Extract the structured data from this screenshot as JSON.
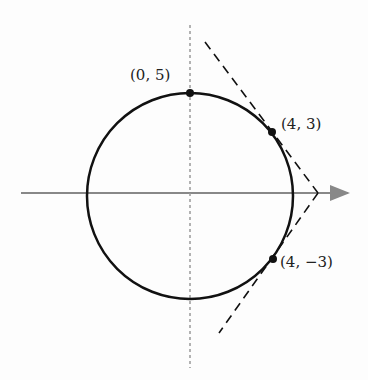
{
  "diagram": {
    "points": [
      {
        "label": "(0, 5)",
        "x": 0,
        "y": 5
      },
      {
        "label": "(4, 3)",
        "x": 4,
        "y": 3
      },
      {
        "label": "(4, −3)",
        "x": 4,
        "y": -3
      }
    ],
    "tangent_intersection": {
      "x": 6.25,
      "y": 0
    },
    "colors": {
      "stroke": "#111111",
      "axis": "#888888"
    }
  }
}
